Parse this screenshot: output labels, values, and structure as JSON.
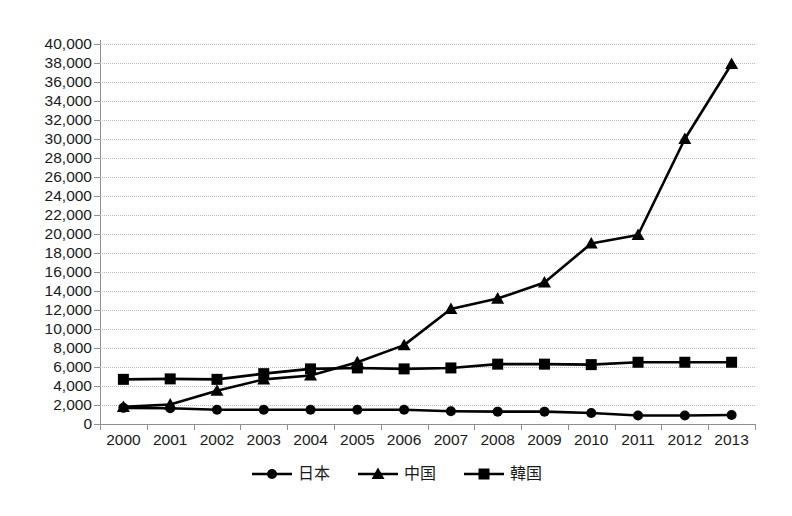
{
  "chart_data": {
    "type": "line",
    "title": "",
    "subtitle": "",
    "xlabel": "",
    "ylabel": "",
    "categories": [
      "2000",
      "2001",
      "2002",
      "2003",
      "2004",
      "2005",
      "2006",
      "2007",
      "2008",
      "2009",
      "2010",
      "2011",
      "2012",
      "2013"
    ],
    "series": [
      {
        "name": "日本",
        "marker": "circle",
        "color": "#000000",
        "values": [
          1700,
          1650,
          1500,
          1500,
          1500,
          1500,
          1500,
          1350,
          1300,
          1300,
          1150,
          900,
          900,
          950
        ]
      },
      {
        "name": "中国",
        "marker": "triangle",
        "color": "#000000",
        "values": [
          1800,
          2050,
          3500,
          4700,
          5100,
          6500,
          8300,
          12100,
          13200,
          14900,
          19000,
          19900,
          30000,
          37900
        ]
      },
      {
        "name": "韓国",
        "marker": "square",
        "color": "#000000",
        "values": [
          4700,
          4750,
          4700,
          5300,
          5800,
          5900,
          5800,
          5900,
          6300,
          6300,
          6250,
          6500,
          6500,
          6500
        ]
      }
    ],
    "ylim": [
      0,
      40000
    ],
    "y_ticks": [
      0,
      2000,
      4000,
      6000,
      8000,
      10000,
      12000,
      14000,
      16000,
      18000,
      20000,
      22000,
      24000,
      26000,
      28000,
      30000,
      32000,
      34000,
      36000,
      38000,
      40000
    ],
    "y_tick_labels": [
      "0",
      "2,000",
      "4,000",
      "6,000",
      "8,000",
      "10,000",
      "12,000",
      "14,000",
      "16,000",
      "18,000",
      "20,000",
      "22,000",
      "24,000",
      "26,000",
      "28,000",
      "30,000",
      "32,000",
      "34,000",
      "36,000",
      "38,000",
      "40,000"
    ],
    "grid": true,
    "grid_axis": "y",
    "grid_style": "dotted",
    "grid_color": "#b9b9c4",
    "axis_color": "#8f8f8f",
    "legend_position": "bottom",
    "annotations": []
  },
  "legend": {
    "entries": [
      {
        "label": "日本",
        "marker": "circle"
      },
      {
        "label": "中国",
        "marker": "triangle"
      },
      {
        "label": "韓国",
        "marker": "square"
      }
    ]
  }
}
